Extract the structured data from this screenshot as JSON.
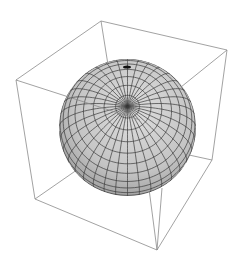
{
  "figure": {
    "type": "3d-sphere-plot",
    "background": "#ffffff",
    "box_color": "#8a8a8a",
    "mesh_color": "#3a3a3a",
    "surface_light": "#d6d6d6",
    "surface_dark": "#7a7a7a",
    "sphere": {
      "cx": 127.5,
      "cy": 127.5,
      "r": 68.5,
      "tilt_deg": 72,
      "lat_lines": 18,
      "lon_lines": 36
    },
    "box_vertices": {
      "back_top": [
        101,
        21
      ],
      "right_top": [
        227,
        50
      ],
      "left_top": [
        16,
        80
      ],
      "front_top": [
        140,
        120
      ],
      "left_bottom": [
        35,
        199
      ],
      "right_bottom": [
        212,
        160
      ],
      "front_bottom": [
        157,
        250
      ],
      "back_bottom": [
        120,
        140
      ]
    }
  }
}
